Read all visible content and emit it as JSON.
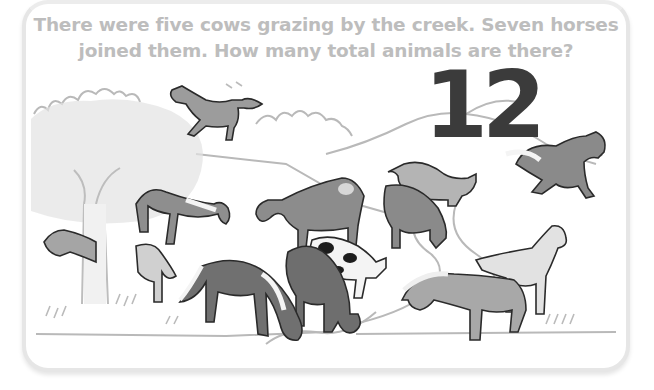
{
  "worksheet": {
    "question_line_1": "There were five cows grazing by the creek. Seven horses",
    "question_line_2": "joined them. How many total animals are there?",
    "answer": "12"
  },
  "illustration": {
    "description": "Pasture scene by a creek with grazing cows and horses, grayscale",
    "cows_count": 5,
    "horses_count": 7,
    "colors": {
      "question_text": "#bdbdbd",
      "answer_text": "#3b3b3b",
      "card_border": "#e6e6e6",
      "outline": "#2a2a2a",
      "dark_animal": "#707070",
      "mid_animal": "#959595",
      "light_animal": "#c8c8c8",
      "landscape_line": "#b5b5b5"
    }
  }
}
